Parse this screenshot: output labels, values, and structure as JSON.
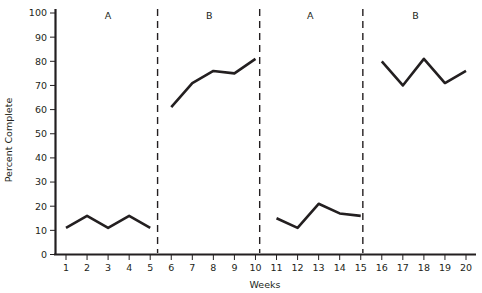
{
  "chart_data": {
    "type": "line",
    "title": "",
    "xlabel": "Weeks",
    "ylabel": "Percent Complete",
    "xlim": [
      0.4,
      20.6
    ],
    "ylim": [
      0,
      100
    ],
    "grid": false,
    "legend": "none",
    "x_ticks": [
      1,
      2,
      3,
      4,
      5,
      6,
      7,
      8,
      9,
      10,
      11,
      12,
      13,
      14,
      15,
      16,
      17,
      18,
      19,
      20
    ],
    "y_ticks": [
      0,
      10,
      20,
      30,
      40,
      50,
      60,
      70,
      80,
      90,
      100
    ],
    "x": [
      1,
      2,
      3,
      4,
      5,
      6,
      7,
      8,
      9,
      10,
      11,
      12,
      13,
      14,
      15,
      16,
      17,
      18,
      19,
      20
    ],
    "series": [
      {
        "name": "Phase A (baseline 1)",
        "x": [
          1,
          2,
          3,
          4,
          5
        ],
        "values": [
          11,
          16,
          11,
          16,
          11
        ]
      },
      {
        "name": "Phase B (intervention 1)",
        "x": [
          6,
          7,
          8,
          9,
          10
        ],
        "values": [
          61,
          71,
          76,
          75,
          81
        ]
      },
      {
        "name": "Phase A (baseline 2)",
        "x": [
          11,
          12,
          13,
          14,
          15
        ],
        "values": [
          15,
          11,
          21,
          17,
          16
        ]
      },
      {
        "name": "Phase B (intervention 2)",
        "x": [
          16,
          17,
          18,
          19,
          20
        ],
        "values": [
          80,
          70,
          81,
          71,
          76
        ]
      }
    ],
    "phase_dividers": [
      5.35,
      10.2,
      15.1
    ],
    "phase_labels": [
      {
        "label": "A",
        "center_week": 3.0
      },
      {
        "label": "B",
        "center_week": 7.8
      },
      {
        "label": "A",
        "center_week": 12.6
      },
      {
        "label": "B",
        "center_week": 17.6
      }
    ],
    "line_color": "#231f20",
    "axis_color": "#231f20",
    "divider_color": "#231f20",
    "background_color": "#ffffff"
  },
  "axes": {
    "y_title": "Percent Complete",
    "x_title": "Weeks",
    "y_tick_labels": [
      "100",
      "90",
      "80",
      "70",
      "60",
      "50",
      "40",
      "30",
      "20",
      "10",
      "0"
    ],
    "x_tick_labels": [
      "1",
      "2",
      "3",
      "4",
      "5",
      "6",
      "7",
      "8",
      "9",
      "10",
      "11",
      "12",
      "13",
      "14",
      "15",
      "16",
      "17",
      "18",
      "19",
      "20"
    ]
  },
  "phases": {
    "labels": [
      "A",
      "B",
      "A",
      "B"
    ]
  }
}
